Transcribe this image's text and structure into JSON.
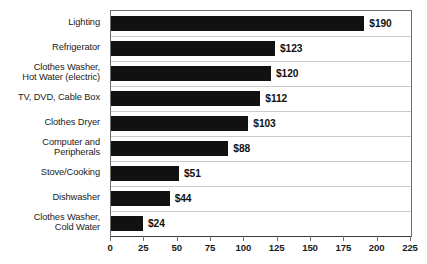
{
  "chart_data": {
    "type": "bar",
    "orientation": "horizontal",
    "title": "",
    "subtitle": "",
    "xlabel": "",
    "ylabel": "",
    "xlim": [
      0,
      225
    ],
    "xticks": [
      0,
      25,
      50,
      75,
      100,
      125,
      150,
      175,
      200,
      225
    ],
    "xtick_labels": [
      "0",
      "25",
      "50",
      "75",
      "100",
      "125",
      "150",
      "175",
      "200",
      "225"
    ],
    "grid": "horizontal-row-separators",
    "legend": "none",
    "bar_color": "#111111",
    "categories": [
      "Lighting",
      "Refrigerator",
      "Clothes Washer, Hot Water (electric)",
      "TV, DVD, Cable Box",
      "Clothes Dryer",
      "Computer and Peripherals",
      "Stove/Cooking",
      "Dishwasher",
      "Clothes Washer, Cold Water"
    ],
    "category_lines": [
      [
        "Lighting"
      ],
      [
        "Refrigerator"
      ],
      [
        "Clothes Washer,",
        "Hot Water (electric)"
      ],
      [
        "TV, DVD, Cable Box"
      ],
      [
        "Clothes Dryer"
      ],
      [
        "Computer and",
        "Peripherals"
      ],
      [
        "Stove/Cooking"
      ],
      [
        "Dishwasher"
      ],
      [
        "Clothes Washer,",
        "Cold Water"
      ]
    ],
    "values": [
      190,
      123,
      120,
      112,
      103,
      88,
      51,
      44,
      24
    ],
    "value_labels": [
      "$190",
      "$123",
      "$120",
      "$112",
      "$103",
      "$88",
      "$51",
      "$44",
      "$24"
    ]
  }
}
